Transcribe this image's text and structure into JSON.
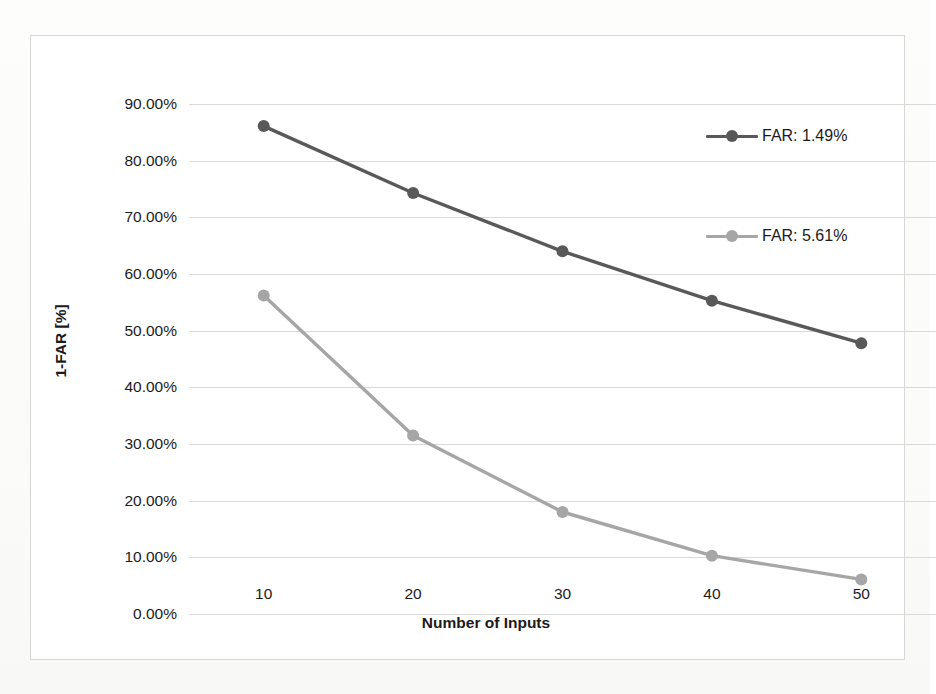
{
  "chart_data": {
    "type": "line",
    "title": "",
    "xlabel": "Number of Inputs",
    "ylabel": "1-FAR [%]",
    "x": [
      10,
      20,
      30,
      40,
      50
    ],
    "xticklabels": [
      "10",
      "20",
      "30",
      "40",
      "50"
    ],
    "yticklabels": [
      "0.00%",
      "10.00%",
      "20.00%",
      "30.00%",
      "40.00%",
      "50.00%",
      "60.00%",
      "70.00%",
      "80.00%",
      "90.00%"
    ],
    "ytickvalues": [
      0,
      10,
      20,
      30,
      40,
      50,
      60,
      70,
      80,
      90
    ],
    "ylim": [
      0,
      90
    ],
    "grid": "horizontal",
    "legend_position": "inside-right",
    "series": [
      {
        "name": "FAR: 1.49%",
        "color": "#595959",
        "marker": "circle",
        "values": [
          86.1,
          74.3,
          64.0,
          55.3,
          47.8
        ]
      },
      {
        "name": "FAR: 5.61%",
        "color": "#a6a6a6",
        "marker": "circle",
        "values": [
          56.2,
          31.5,
          18.0,
          10.3,
          6.1
        ]
      }
    ]
  },
  "axes": {
    "y_title": "1-FAR [%]",
    "x_title": "Number of Inputs"
  },
  "legend": {
    "items": [
      {
        "label": "FAR: 1.49%",
        "color": "#595959"
      },
      {
        "label": "FAR: 5.61%",
        "color": "#a6a6a6"
      }
    ]
  },
  "colors": {
    "series_dark": "#595959",
    "series_light": "#a6a6a6",
    "gridline": "#d9d9d9",
    "frame_border": "#d7d7d7",
    "text": "#1c1c1c",
    "background": "#ffffff"
  }
}
